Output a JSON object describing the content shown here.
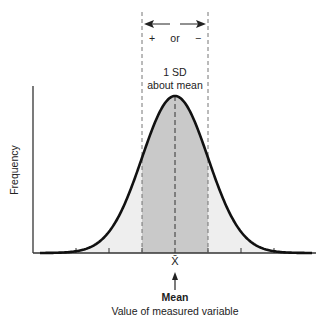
{
  "chart_data": {
    "type": "area",
    "title": "",
    "distribution": "normal",
    "xlabel": "Value of measured variable",
    "ylabel": "Frequency",
    "mean_symbol": "X̄",
    "mean_label": "Mean",
    "sd_annotation": {
      "range_label": "+ or −",
      "line1": "1 SD",
      "line2": "about mean"
    },
    "x_ticks_sd": [
      -3,
      -2,
      -1,
      0,
      1,
      2,
      3
    ],
    "shaded_region_sd": [
      -1,
      1
    ],
    "colors": {
      "curve": "#111111",
      "inner_fill": "#c9c9c9",
      "outer_fill": "#eeeeee",
      "axis": "#333333"
    },
    "grid": false,
    "legend": null
  },
  "labels": {
    "plus": "+",
    "or": "or",
    "minus": "−",
    "sd_line1": "1 SD",
    "sd_line2": "about mean",
    "ylabel": "Frequency",
    "xbar": "X̄",
    "mean": "Mean",
    "xlabel": "Value of measured variable"
  }
}
